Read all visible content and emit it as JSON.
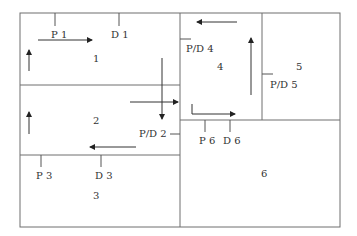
{
  "diagram": {
    "type": "facility-layout",
    "departments": [
      {
        "id": "1",
        "label": "1"
      },
      {
        "id": "2",
        "label": "2"
      },
      {
        "id": "3",
        "label": "3"
      },
      {
        "id": "4",
        "label": "4"
      },
      {
        "id": "5",
        "label": "5"
      },
      {
        "id": "6",
        "label": "6"
      }
    ],
    "stations": {
      "p1": "P 1",
      "d1": "D 1",
      "pd2": "P/D 2",
      "p3": "P 3",
      "d3": "D 3",
      "pd4": "P/D 4",
      "pd5": "P/D 5",
      "p6": "P 6",
      "d6": "D 6"
    },
    "colors": {
      "wall": "#6e6e6e",
      "flow": "#333333",
      "text": "#333333"
    }
  }
}
